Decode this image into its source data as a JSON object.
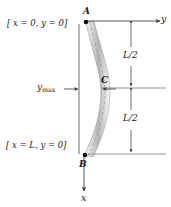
{
  "figure": {
    "background_color": "#ffffff",
    "line_color": "#3a3a3a",
    "beam_fill_light": "#f2f2f2",
    "beam_fill_dark": "#9a9a9a",
    "text_color": "#1b1b1b"
  },
  "labels": {
    "end_a_condition": "[ x = 0, y = 0]",
    "end_b_condition": "[ x = L, y = 0]",
    "point_a": "A",
    "point_b": "B",
    "point_c": "C",
    "axis_y": "y",
    "axis_x": "x",
    "deflection": "y",
    "deflection_subscript": "max",
    "dimension_upper": "L/2",
    "dimension_lower": "L/2"
  },
  "geometry": {
    "point_a_px": [
      86,
      22
    ],
    "point_b_px": [
      84,
      155
    ],
    "point_c_px": [
      97,
      89
    ],
    "reference_line_x_px": 79,
    "dimension_line_x_px": 131,
    "extension_line_right_px": 166
  }
}
